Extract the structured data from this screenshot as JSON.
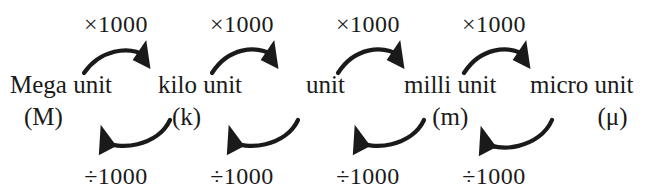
{
  "diagram": {
    "background_color": "#ffffff",
    "ink_color": "#1a1a1a",
    "units": [
      {
        "name": "Mega unit",
        "symbol": "(M)",
        "symbol_align": "left",
        "x": 10,
        "y": 72
      },
      {
        "name": "kilo unit",
        "symbol": "(k)",
        "symbol_align": "left",
        "x": 158,
        "y": 72
      },
      {
        "name": "unit",
        "symbol": "",
        "symbol_align": "none",
        "x": 306,
        "y": 72
      },
      {
        "name": "milli unit",
        "symbol": "(m)",
        "symbol_align": "center",
        "x": 404,
        "y": 72
      },
      {
        "name": "micro unit",
        "symbol": "(μ)",
        "symbol_align": "right",
        "x": 530,
        "y": 72
      }
    ],
    "multiply_label": "×1000",
    "divide_label": "÷1000",
    "top_labels": [
      {
        "text": "×1000",
        "x": 116,
        "y": 12
      },
      {
        "text": "×1000",
        "x": 242,
        "y": 12
      },
      {
        "text": "×1000",
        "x": 368,
        "y": 12
      },
      {
        "text": "×1000",
        "x": 494,
        "y": 12
      }
    ],
    "bottom_labels": [
      {
        "text": "÷1000",
        "x": 116,
        "y": 164
      },
      {
        "text": "÷1000",
        "x": 242,
        "y": 164
      },
      {
        "text": "÷1000",
        "x": 368,
        "y": 164
      },
      {
        "text": "÷1000",
        "x": 494,
        "y": 164
      }
    ],
    "top_arrows": [
      {
        "from": "Mega unit",
        "to": "kilo unit",
        "operation": "×1000",
        "direction": "right"
      },
      {
        "from": "kilo unit",
        "to": "unit",
        "operation": "×1000",
        "direction": "right"
      },
      {
        "from": "unit",
        "to": "milli unit",
        "operation": "×1000",
        "direction": "right"
      },
      {
        "from": "milli unit",
        "to": "micro unit",
        "operation": "×1000",
        "direction": "right"
      }
    ],
    "bottom_arrows": [
      {
        "from": "kilo unit",
        "to": "Mega unit",
        "operation": "÷1000",
        "direction": "left"
      },
      {
        "from": "unit",
        "to": "kilo unit",
        "operation": "÷1000",
        "direction": "left"
      },
      {
        "from": "milli unit",
        "to": "unit",
        "operation": "÷1000",
        "direction": "left"
      },
      {
        "from": "micro unit",
        "to": "milli unit",
        "operation": "÷1000",
        "direction": "left"
      }
    ]
  }
}
